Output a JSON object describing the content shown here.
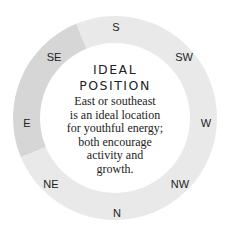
{
  "compass": {
    "directions": [
      {
        "label": "S",
        "x": 116,
        "y": 27
      },
      {
        "label": "SW",
        "x": 184,
        "y": 57
      },
      {
        "label": "W",
        "x": 206,
        "y": 123
      },
      {
        "label": "NW",
        "x": 180,
        "y": 184
      },
      {
        "label": "N",
        "x": 117,
        "y": 213
      },
      {
        "label": "NE",
        "x": 51,
        "y": 184
      },
      {
        "label": "E",
        "x": 27,
        "y": 123
      },
      {
        "label": "SE",
        "x": 54,
        "y": 57
      }
    ],
    "highlighted": [
      "SE",
      "E"
    ],
    "colors": {
      "ring": "#e9e9e9",
      "highlight": "#d6d6d6"
    }
  },
  "center": {
    "title_line1": "IDEAL",
    "title_line2": "POSITION",
    "body_lines": [
      "East or southeast",
      "is an ideal location",
      "for youthful energy;",
      "both encourage",
      "activity and",
      "growth."
    ]
  }
}
